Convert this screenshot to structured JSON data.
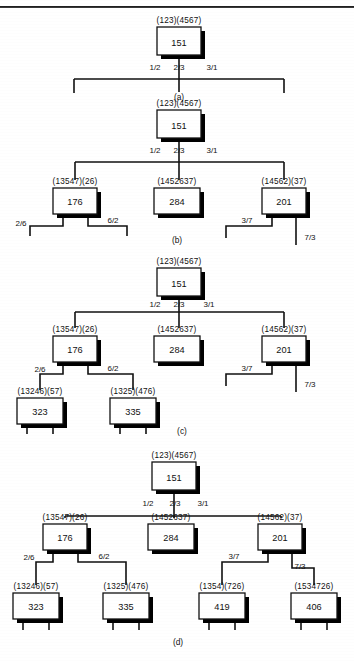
{
  "figure": {
    "top_rule": true,
    "panels": [
      {
        "id": "a",
        "caption": "(a)",
        "nodes": [
          {
            "id": "a-root",
            "label": "(123)(4567)",
            "value": "151",
            "x": 157,
            "y": 27,
            "w": 44,
            "h": 28
          }
        ],
        "edges": [
          {
            "label": "1/2"
          },
          {
            "label": "2/3"
          },
          {
            "label": "3/1"
          }
        ],
        "stubs": 3
      },
      {
        "id": "b",
        "caption": "(b)",
        "nodes": [
          {
            "id": "b-root",
            "label": "(123)(4567)",
            "value": "151",
            "x": 157,
            "y": 110,
            "w": 44,
            "h": 28
          },
          {
            "id": "b-left",
            "label": "(13547)(26)",
            "value": "176",
            "x": 53,
            "y": 188,
            "w": 44,
            "h": 26
          },
          {
            "id": "b-mid",
            "label": "(1452637)",
            "value": "284",
            "x": 154,
            "y": 188,
            "w": 46,
            "h": 26
          },
          {
            "id": "b-right",
            "label": "(14562)(37)",
            "value": "201",
            "x": 262,
            "y": 188,
            "w": 44,
            "h": 26
          }
        ],
        "edges": [
          {
            "label": "1/2"
          },
          {
            "label": "2/3"
          },
          {
            "label": "3/1"
          },
          {
            "label": "2/6"
          },
          {
            "label": "6/2"
          },
          {
            "label": "3/7"
          },
          {
            "label": "7/3"
          }
        ]
      },
      {
        "id": "c",
        "caption": "(c)",
        "nodes": [
          {
            "id": "c-root",
            "label": "(123)(4567)",
            "value": "151",
            "x": 157,
            "y": 268,
            "w": 44,
            "h": 28
          },
          {
            "id": "c-left",
            "label": "(13547)(26)",
            "value": "176",
            "x": 53,
            "y": 336,
            "w": 44,
            "h": 26
          },
          {
            "id": "c-mid",
            "label": "(1452637)",
            "value": "284",
            "x": 154,
            "y": 336,
            "w": 46,
            "h": 26
          },
          {
            "id": "c-right",
            "label": "(14562)(37)",
            "value": "201",
            "x": 262,
            "y": 336,
            "w": 44,
            "h": 26
          },
          {
            "id": "c-ll",
            "label": "(13246)(57)",
            "value": "323",
            "x": 17,
            "y": 398,
            "w": 46,
            "h": 26
          },
          {
            "id": "c-lr",
            "label": "(1325)(476)",
            "value": "335",
            "x": 110,
            "y": 398,
            "w": 46,
            "h": 26
          }
        ],
        "edges": [
          {
            "label": "1/2"
          },
          {
            "label": "2/3"
          },
          {
            "label": "3/1"
          },
          {
            "label": "2/6"
          },
          {
            "label": "6/2"
          },
          {
            "label": "3/7"
          },
          {
            "label": "7/3"
          }
        ]
      },
      {
        "id": "d",
        "caption": "(d)",
        "nodes": [
          {
            "id": "d-root",
            "label": "(123)(4567)",
            "value": "151",
            "x": 152,
            "y": 462,
            "w": 44,
            "h": 28
          },
          {
            "id": "d-left",
            "label": "(13547)(26)",
            "value": "176",
            "x": 43,
            "y": 524,
            "w": 44,
            "h": 26
          },
          {
            "id": "d-mid",
            "label": "(1452637)",
            "value": "284",
            "x": 148,
            "y": 524,
            "w": 46,
            "h": 26
          },
          {
            "id": "d-right",
            "label": "(14562)(37)",
            "value": "201",
            "x": 258,
            "y": 524,
            "w": 44,
            "h": 26
          },
          {
            "id": "d-ll",
            "label": "(13246)(57)",
            "value": "323",
            "x": 13,
            "y": 593,
            "w": 46,
            "h": 26
          },
          {
            "id": "d-lr",
            "label": "(1325)(476)",
            "value": "335",
            "x": 103,
            "y": 593,
            "w": 46,
            "h": 26
          },
          {
            "id": "d-rl",
            "label": "(1354)(726)",
            "value": "419",
            "x": 199,
            "y": 593,
            "w": 46,
            "h": 26
          },
          {
            "id": "d-rr",
            "label": "(1534726)",
            "value": "406",
            "x": 291,
            "y": 593,
            "w": 46,
            "h": 26
          }
        ],
        "edges": [
          {
            "label": "1/2"
          },
          {
            "label": "2/3"
          },
          {
            "label": "3/1"
          },
          {
            "label": "2/6"
          },
          {
            "label": "6/2"
          },
          {
            "label": "3/7"
          },
          {
            "label": "7/3"
          }
        ]
      }
    ]
  },
  "colors": {
    "ink": "#111111",
    "paper": "#ffffff",
    "shadow": "#000000",
    "box_fill": "#ffffff"
  }
}
